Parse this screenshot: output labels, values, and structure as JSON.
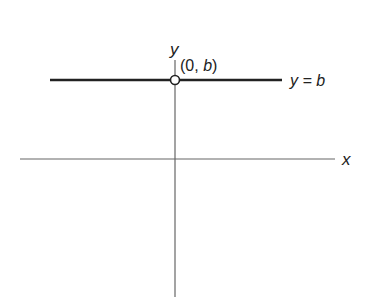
{
  "diagram": {
    "x_axis_label": "x",
    "y_axis_label": "y",
    "line_label": "y = b",
    "point_label_open": "(0, ",
    "point_label_var": "b",
    "point_label_close": ")",
    "colors": {
      "axis": "#555555",
      "line": "#222222",
      "text": "#222222",
      "point_fill": "#ffffff"
    }
  }
}
